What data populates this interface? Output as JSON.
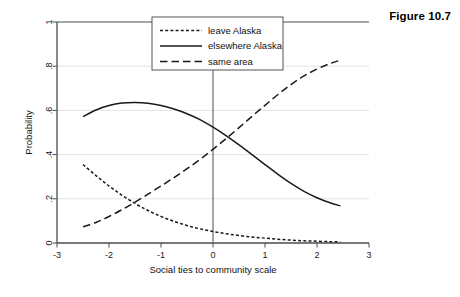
{
  "figure": {
    "caption": "Figure 10.7"
  },
  "chart_data": {
    "type": "line",
    "title": "",
    "xlabel": "Social ties to community scale",
    "ylabel": "Probability",
    "xlim": [
      -3,
      3
    ],
    "ylim": [
      0,
      1
    ],
    "xticks": [
      -3,
      -2,
      -1,
      0,
      1,
      2,
      3
    ],
    "xticklabels": [
      "-3",
      "-2",
      "-1",
      "0",
      "1",
      "2",
      "3"
    ],
    "yticks": [
      0,
      0.2,
      0.4,
      0.6,
      0.8,
      1
    ],
    "yticklabels": [
      "0",
      ".2",
      ".4",
      ".6",
      ".8",
      "1"
    ],
    "grid": true,
    "grid_axis": "y",
    "legend_position": "top-center",
    "reference_line_x": 0,
    "x": [
      -2.5,
      -2.25,
      -2.0,
      -1.75,
      -1.5,
      -1.25,
      -1.0,
      -0.75,
      -0.5,
      -0.25,
      0.0,
      0.25,
      0.5,
      0.75,
      1.0,
      1.25,
      1.5,
      1.75,
      2.0,
      2.25,
      2.45
    ],
    "series": [
      {
        "name": "leave Alaska",
        "style": "dotted",
        "values": [
          0.355,
          0.305,
          0.258,
          0.216,
          0.179,
          0.147,
          0.12,
          0.098,
          0.079,
          0.064,
          0.052,
          0.042,
          0.034,
          0.027,
          0.022,
          0.017,
          0.013,
          0.01,
          0.008,
          0.006,
          0.005
        ]
      },
      {
        "name": "elsewhere Alaska",
        "style": "solid",
        "values": [
          0.572,
          0.602,
          0.622,
          0.633,
          0.636,
          0.632,
          0.622,
          0.606,
          0.585,
          0.558,
          0.524,
          0.486,
          0.444,
          0.4,
          0.355,
          0.311,
          0.27,
          0.234,
          0.205,
          0.182,
          0.168
        ]
      },
      {
        "name": "same area",
        "style": "dashed",
        "values": [
          0.073,
          0.093,
          0.12,
          0.151,
          0.185,
          0.221,
          0.258,
          0.296,
          0.336,
          0.378,
          0.424,
          0.472,
          0.522,
          0.573,
          0.623,
          0.672,
          0.717,
          0.756,
          0.787,
          0.812,
          0.827
        ]
      }
    ],
    "legend_entries": [
      "leave Alaska",
      "elsewhere Alaska",
      "same area"
    ],
    "colors": {
      "line": "#1a1a1a",
      "grid": "#e3e3e3",
      "axis": "#4d4d4d",
      "panel_background": "#f0f0ef",
      "plot_background": "#ffffff"
    }
  }
}
